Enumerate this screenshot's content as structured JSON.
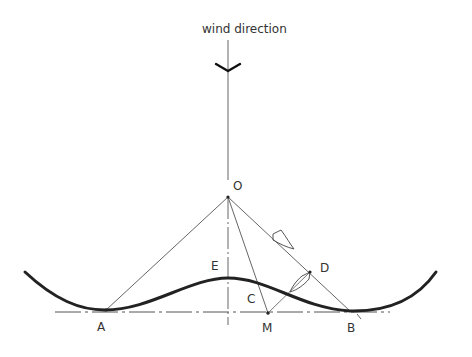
{
  "title": "wind direction",
  "points": {
    "O": "O",
    "A": "A",
    "B": "B",
    "C": "C",
    "D": "D",
    "E": "E",
    "M": "M"
  },
  "colors": {
    "line": "#555555",
    "curve": "#222222",
    "background": "#ffffff"
  }
}
